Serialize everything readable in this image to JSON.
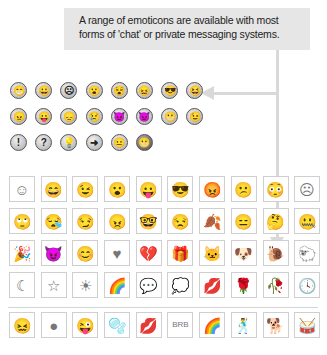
{
  "callout": {
    "text_line1": "A range of emoticons are available with most",
    "text_line2": "forms of 'chat' or private messaging systems."
  },
  "small_emoticons": [
    [
      {
        "name": "big-grin",
        "glyph": "😁"
      },
      {
        "name": "grin",
        "glyph": "😀"
      },
      {
        "name": "frown",
        "glyph": "☹"
      },
      {
        "name": "surprised",
        "glyph": "😮"
      },
      {
        "name": "dizzy",
        "glyph": "😵"
      },
      {
        "name": "wavy-mouth",
        "glyph": "😖"
      },
      {
        "name": "sunglasses",
        "glyph": "😎"
      },
      {
        "name": "laughing",
        "glyph": "😆"
      }
    ],
    [
      {
        "name": "angry",
        "glyph": "😠"
      },
      {
        "name": "tongue-out",
        "glyph": "😛"
      },
      {
        "name": "sad",
        "glyph": "😞"
      },
      {
        "name": "crying",
        "glyph": "😢"
      },
      {
        "name": "devil",
        "glyph": "😈"
      },
      {
        "name": "evil",
        "glyph": "👿"
      },
      {
        "name": "embarrassed",
        "glyph": "😬"
      },
      {
        "name": "wink",
        "glyph": "😉"
      }
    ],
    [
      {
        "name": "exclamation",
        "glyph": "!"
      },
      {
        "name": "question",
        "glyph": "?"
      },
      {
        "name": "idea",
        "glyph": "💡"
      },
      {
        "name": "arrow",
        "glyph": "➜"
      },
      {
        "name": "neutral",
        "glyph": "😐"
      },
      {
        "name": "teeth-grin",
        "glyph": "😬"
      }
    ]
  ],
  "large_emoticons": [
    [
      {
        "name": "smile",
        "glyph": "☺"
      },
      {
        "name": "big-smile",
        "glyph": "😄"
      },
      {
        "name": "wink",
        "glyph": "😉"
      },
      {
        "name": "surprised",
        "glyph": "😮"
      },
      {
        "name": "tongue",
        "glyph": "😛"
      },
      {
        "name": "cool",
        "glyph": "😎"
      },
      {
        "name": "angry",
        "glyph": "😡"
      },
      {
        "name": "confused",
        "glyph": "😕"
      },
      {
        "name": "embarrassed",
        "glyph": "😳"
      },
      {
        "name": "sad",
        "glyph": "☹"
      }
    ],
    [
      {
        "name": "eye-roll",
        "glyph": "🙄"
      },
      {
        "name": "sleepy",
        "glyph": "😪"
      },
      {
        "name": "smirk",
        "glyph": "😏"
      },
      {
        "name": "mad",
        "glyph": "😠"
      },
      {
        "name": "nerd",
        "glyph": "🤓"
      },
      {
        "name": "sarcastic",
        "glyph": "😒"
      },
      {
        "name": "leaf",
        "glyph": "🍂"
      },
      {
        "name": "disappointed",
        "glyph": "😑"
      },
      {
        "name": "thinking",
        "glyph": "🤔"
      },
      {
        "name": "sealed-lips",
        "glyph": "🤐"
      }
    ],
    [
      {
        "name": "party",
        "glyph": "🎉"
      },
      {
        "name": "devil",
        "glyph": "😈"
      },
      {
        "name": "shy",
        "glyph": "😊"
      },
      {
        "name": "heart",
        "glyph": "♥"
      },
      {
        "name": "broken-heart",
        "glyph": "💔"
      },
      {
        "name": "gift",
        "glyph": "🎁"
      },
      {
        "name": "cat",
        "glyph": "🐱"
      },
      {
        "name": "dog",
        "glyph": "🐶"
      },
      {
        "name": "snail",
        "glyph": "🐌"
      },
      {
        "name": "sheep",
        "glyph": "🐑"
      }
    ],
    [
      {
        "name": "moon",
        "glyph": "☾"
      },
      {
        "name": "star",
        "glyph": "☆"
      },
      {
        "name": "sun",
        "glyph": "☀"
      },
      {
        "name": "rainbow",
        "glyph": "🌈"
      },
      {
        "name": "girl-chat",
        "glyph": "💬"
      },
      {
        "name": "boy-chat",
        "glyph": "💭"
      },
      {
        "name": "lips",
        "glyph": "💋"
      },
      {
        "name": "rose",
        "glyph": "🌹"
      },
      {
        "name": "wilted-rose",
        "glyph": "🥀"
      },
      {
        "name": "clock",
        "glyph": "🕓"
      }
    ]
  ],
  "bottom_emoticons": [
    {
      "name": "wavy-face",
      "glyph": "😖"
    },
    {
      "name": "dark-splat",
      "glyph": "●"
    },
    {
      "name": "winking-face",
      "glyph": "😜"
    },
    {
      "name": "bubbles",
      "glyph": "🫧"
    },
    {
      "name": "kiss-wreath",
      "glyph": "💋"
    },
    {
      "name": "brb",
      "glyph": "BRB"
    },
    {
      "name": "rainbow",
      "glyph": "🌈"
    },
    {
      "name": "dancing",
      "glyph": "🕺"
    },
    {
      "name": "dog",
      "glyph": "🐕"
    },
    {
      "name": "drums",
      "glyph": "🥁"
    }
  ]
}
